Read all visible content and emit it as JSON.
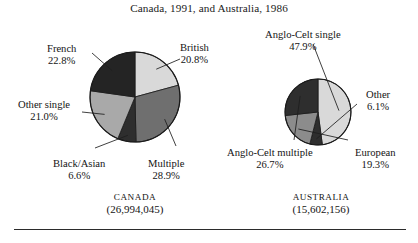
{
  "figure": {
    "title": "Canada, 1991, and Australia, 1986",
    "rule_present": true
  },
  "charts": [
    {
      "id": "canada",
      "country_name": "CANADA",
      "population": "(26,994,045)",
      "center": {
        "x": 135,
        "y": 97
      },
      "radius": 45,
      "slices": [
        {
          "label": "British",
          "value": 20.8,
          "pct_text": "20.8%",
          "color": "#d9d9d9"
        },
        {
          "label": "Multiple",
          "value": 28.9,
          "pct_text": "28.9%",
          "color": "#6f6f6f"
        },
        {
          "label": "Black/Asian",
          "value": 6.6,
          "pct_text": "6.6%",
          "color": "#2e2e2e"
        },
        {
          "label": "Other single",
          "value": 21.0,
          "pct_text": "21.0%",
          "color": "#a9a9a9"
        },
        {
          "label": "French",
          "value": 22.8,
          "pct_text": "22.8%",
          "color": "#242424"
        }
      ]
    },
    {
      "id": "australia",
      "country_name": "AUSTRALIA",
      "population": "(15,602,156)",
      "center": {
        "x": 318,
        "y": 112
      },
      "radius": 33,
      "slices": [
        {
          "label": "Anglo-Celt single",
          "value": 47.9,
          "pct_text": "47.9%",
          "color": "#d9d9d9"
        },
        {
          "label": "Other",
          "value": 6.1,
          "pct_text": "6.1%",
          "color": "#2e2e2e"
        },
        {
          "label": "European",
          "value": 19.3,
          "pct_text": "19.3%",
          "color": "#8c8c8c"
        },
        {
          "label": "Anglo-Celt multiple",
          "value": 26.7,
          "pct_text": "26.7%",
          "color": "#2e2e2e"
        }
      ]
    }
  ],
  "labels": {
    "canada": {
      "french": {
        "name": "French",
        "pct": "22.8%",
        "x": 47,
        "y": 43,
        "anchor": "center"
      },
      "british": {
        "name": "British",
        "pct": "20.8%",
        "x": 180,
        "y": 42,
        "anchor": "center"
      },
      "other_single": {
        "name": "Other single",
        "pct": "21.0%",
        "x": 18,
        "y": 99,
        "anchor": "center"
      },
      "black_asian": {
        "name": "Black/Asian",
        "pct": "6.6%",
        "x": 53,
        "y": 158,
        "anchor": "center"
      },
      "multiple": {
        "name": "Multiple",
        "pct": "28.9%",
        "x": 148,
        "y": 158,
        "anchor": "center"
      }
    },
    "australia": {
      "anglo_celt_single": {
        "name": "Anglo-Celt single",
        "pct": "47.9%",
        "x": 265,
        "y": 29,
        "anchor": "center"
      },
      "other": {
        "name": "Other",
        "pct": "6.1%",
        "x": 366,
        "y": 89,
        "anchor": "center"
      },
      "european": {
        "name": "European",
        "pct": "19.3%",
        "x": 355,
        "y": 147,
        "anchor": "center"
      },
      "anglo_celt_multiple": {
        "name": "Anglo-Celt multiple",
        "pct": "26.7%",
        "x": 227,
        "y": 147,
        "anchor": "center"
      }
    }
  },
  "country_captions": {
    "canada": {
      "x": 82,
      "y": 192
    },
    "australia": {
      "x": 268,
      "y": 192
    }
  },
  "chart_data": [
    {
      "type": "pie",
      "title": "Canada, 1991, and Australia, 1986",
      "subtitle": "CANADA (26,994,045)",
      "categories": [
        "British",
        "Multiple",
        "Black/Asian",
        "Other single",
        "French"
      ],
      "values": [
        20.8,
        28.9,
        6.6,
        21.0,
        22.8
      ],
      "units": "percent",
      "total_population": 26994045,
      "total_population_text": "(26,994,045)",
      "colors": [
        "#d9d9d9",
        "#6f6f6f",
        "#2e2e2e",
        "#a9a9a9",
        "#242424"
      ],
      "start_angle_deg": 0,
      "direction": "clockwise",
      "legend": "labels-with-leader-lines",
      "grid": false
    },
    {
      "type": "pie",
      "title": "Canada, 1991, and Australia, 1986",
      "subtitle": "AUSTRALIA (15,602,156)",
      "categories": [
        "Anglo-Celt single",
        "Other",
        "European",
        "Anglo-Celt multiple"
      ],
      "values": [
        47.9,
        6.1,
        19.3,
        26.7
      ],
      "units": "percent",
      "total_population": 15602156,
      "total_population_text": "(15,602,156)",
      "colors": [
        "#d9d9d9",
        "#2e2e2e",
        "#8c8c8c",
        "#2e2e2e"
      ],
      "start_angle_deg": 0,
      "direction": "clockwise",
      "legend": "labels-with-leader-lines",
      "grid": false
    }
  ]
}
